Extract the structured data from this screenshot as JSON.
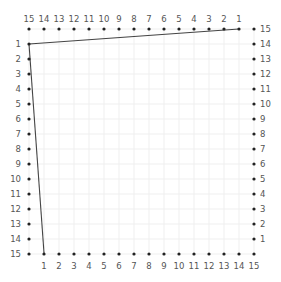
{
  "diagram": {
    "type": "line-design-string-art",
    "grid": {
      "origin_x": 29,
      "origin_y": 29,
      "step": 15,
      "cells": 15,
      "line_color": "#efefef"
    },
    "dot_color": "#222222",
    "label_color": "#555555",
    "line_color": "#444444",
    "top_axis": {
      "labels": [
        "15",
        "14",
        "13",
        "12",
        "11",
        "10",
        "9",
        "8",
        "7",
        "6",
        "5",
        "4",
        "3",
        "2",
        "1"
      ]
    },
    "left_axis": {
      "labels": [
        "1",
        "2",
        "3",
        "4",
        "5",
        "6",
        "7",
        "8",
        "9",
        "10",
        "11",
        "12",
        "13",
        "14",
        "15"
      ]
    },
    "right_axis": {
      "labels": [
        "15",
        "14",
        "13",
        "12",
        "11",
        "10",
        "9",
        "8",
        "7",
        "6",
        "5",
        "4",
        "3",
        "2",
        "1"
      ]
    },
    "bottom_axis": {
      "labels": [
        "1",
        "2",
        "3",
        "4",
        "5",
        "6",
        "7",
        "8",
        "9",
        "10",
        "11",
        "12",
        "13",
        "14",
        "15"
      ]
    },
    "segments": [
      {
        "from": "top-1",
        "to": "left-1",
        "x1": 239,
        "y1": 29,
        "x2": 29,
        "y2": 44
      },
      {
        "from": "left-1",
        "to": "bottom-1",
        "x1": 29,
        "y1": 44,
        "x2": 44,
        "y2": 253
      }
    ]
  }
}
